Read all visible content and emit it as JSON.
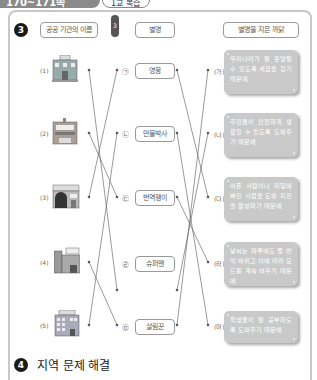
{
  "header": {
    "page_range": "170~171쪽",
    "tag": "1교 복습",
    "tag_num": "3"
  },
  "question3": {
    "number": "3",
    "col_headers": {
      "institution": "공공 기관의 이름",
      "nickname": "별명",
      "reason": "별명을 지은 까닭"
    },
    "institutions": [
      {
        "label": "(1)",
        "sign": "도청",
        "icon": "provincial-office-building-icon"
      },
      {
        "label": "(2)",
        "sign": "박물관",
        "icon": "museum-building-icon"
      },
      {
        "label": "(3)",
        "sign": "소방서",
        "icon": "fire-station-building-icon"
      },
      {
        "label": "(4)",
        "sign": "경찰서",
        "icon": "police-station-building-icon"
      },
      {
        "label": "(5)",
        "sign": "교육청",
        "icon": "education-office-building-icon"
      }
    ],
    "nicknames": [
      {
        "mark": "㉠",
        "text": "영웅"
      },
      {
        "mark": "㉡",
        "text": "만물박사"
      },
      {
        "mark": "㉢",
        "text": "번역쟁이"
      },
      {
        "mark": "㉣",
        "text": "슈퍼맨"
      },
      {
        "mark": "㉤",
        "text": "살림꾼"
      }
    ],
    "reasons": [
      {
        "mark": "(가)",
        "text": "우리나라가 잘 운영될 수 있도록 세금을 걷기 때문에"
      },
      {
        "mark": "(나)",
        "text": "주민들이 안전하게 생활할 수 있도록 도와주기 때문에"
      },
      {
        "mark": "(다)",
        "text": "아픈 사람이나 위험에 빠진 사람을 도와 지진을 활성하기 때문에"
      },
      {
        "mark": "(라)",
        "text": "날씨는 하루에도 몇 번씩 바뀌고 이에 따라 모드를 계속 바꾸기 때문에"
      },
      {
        "mark": "(마)",
        "text": "학생들이 잘 공부하도록 도와주기 때문에"
      }
    ],
    "left_connections": [
      [
        0,
        3
      ],
      [
        1,
        2
      ],
      [
        2,
        0
      ],
      [
        3,
        4
      ],
      [
        4,
        1
      ]
    ],
    "right_connections": [
      [
        0,
        2
      ],
      [
        1,
        4
      ],
      [
        2,
        3
      ],
      [
        3,
        1
      ],
      [
        4,
        0
      ]
    ]
  },
  "question4": {
    "number": "4",
    "title": "지역 문제 해결"
  }
}
